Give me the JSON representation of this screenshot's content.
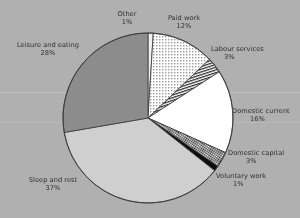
{
  "chart_data": {
    "type": "pie",
    "title": "",
    "subtitle": "",
    "xlabel": "",
    "ylabel": "",
    "legend_position": "outside-labels",
    "grid": false,
    "value_unit": "percent",
    "start_angle_deg": 0,
    "direction": "clockwise",
    "categories": [
      "Other",
      "Paid work",
      "Labour services",
      "Domestic current",
      "Domestic capital",
      "Voluntary work",
      "Sleep and rest",
      "Leisure and eating"
    ],
    "values": [
      1,
      12,
      3,
      16,
      3,
      1,
      37,
      28
    ],
    "slices": [
      {
        "label": "Other",
        "value": 1,
        "pct_text": "1%",
        "fill": "#f2f2f2",
        "pattern": "solid-very-light",
        "label_align": "center"
      },
      {
        "label": "Paid work",
        "value": 12,
        "pct_text": "12%",
        "fill": "#ffffff",
        "pattern": "fine-dotted-stipple",
        "label_align": "center"
      },
      {
        "label": "Labour services",
        "value": 3,
        "pct_text": "3%",
        "fill": "#ffffff",
        "pattern": "steep-line-hatch",
        "label_align": "left"
      },
      {
        "label": "Domestic current",
        "value": 16,
        "pct_text": "16%",
        "fill": "#ffffff",
        "pattern": "solid-white",
        "label_align": "left"
      },
      {
        "label": "Domestic capital",
        "value": 3,
        "pct_text": "3%",
        "fill": "#ffffff",
        "pattern": "checkered-hatch",
        "label_align": "left"
      },
      {
        "label": "Voluntary work",
        "value": 1,
        "pct_text": "1%",
        "fill": "#0d0d0d",
        "pattern": "solid-black",
        "label_align": "left"
      },
      {
        "label": "Sleep and rest",
        "value": 37,
        "pct_text": "37%",
        "fill": "#cfcfcf",
        "pattern": "solid-light-gray",
        "label_align": "center"
      },
      {
        "label": "Leisure and eating",
        "value": 28,
        "pct_text": "28%",
        "fill": "#8c8c8c",
        "pattern": "solid-mid-gray",
        "label_align": "center"
      }
    ],
    "colors": {
      "background": "#b1b1b1",
      "outline": "#3a3a3a",
      "text": "#2f2f2f"
    }
  }
}
